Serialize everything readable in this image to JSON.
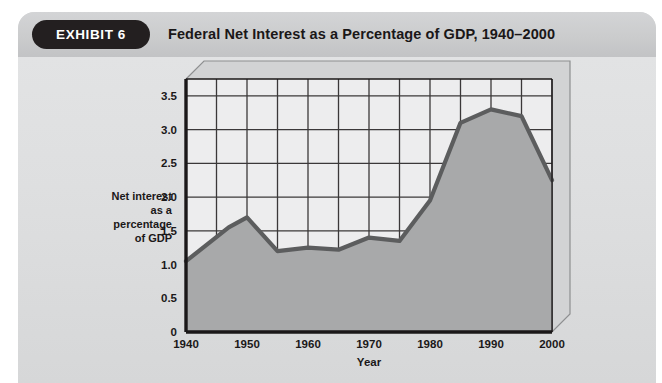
{
  "exhibit": {
    "badge_label": "EXHIBIT 6",
    "title": "Federal Net Interest as a Percentage of GDP, 1940–2000"
  },
  "colors": {
    "badge_background": "#231f20",
    "panel_header": "#cbcccd",
    "panel_body": "#dedfe0",
    "plot_background": "#ededee",
    "area_fill": "#a8a9aa",
    "line": "#5c5d5e",
    "axis": "#1b1819",
    "gridline": "#3b3839",
    "frame_3d": "#8e8f90"
  },
  "chart_data": {
    "type": "area",
    "title": "Federal Net Interest as a Percentage of GDP, 1940–2000",
    "xlabel": "Year",
    "ylabel": "Net interest as a percentage of GDP",
    "ylabel_lines": [
      "Net interest",
      "as a",
      "percentage",
      "of GDP"
    ],
    "xlim": [
      1940,
      2000
    ],
    "ylim": [
      0,
      3.75
    ],
    "grid": true,
    "grid_x_step": 5,
    "grid_y_step": 0.5,
    "legend": "none",
    "xticks": [
      1940,
      1950,
      1960,
      1970,
      1980,
      1990,
      2000
    ],
    "xtick_labels": [
      "1940",
      "1950",
      "1960",
      "1970",
      "1980",
      "1990",
      "2000"
    ],
    "yticks": [
      0,
      0.5,
      1.0,
      1.5,
      2.0,
      2.5,
      3.0,
      3.5
    ],
    "ytick_labels": [
      "0",
      "0.5",
      "1.0",
      "1.5",
      "2.0",
      "2.5",
      "3.0",
      "3.5"
    ],
    "series": [
      {
        "name": "Net interest as a percentage of GDP",
        "x": [
          1940,
          1947,
          1950,
          1955,
          1960,
          1965,
          1970,
          1975,
          1980,
          1985,
          1990,
          1995,
          2000
        ],
        "values": [
          1.05,
          1.55,
          1.7,
          1.2,
          1.25,
          1.22,
          1.4,
          1.35,
          1.95,
          3.1,
          3.3,
          3.2,
          2.25
        ]
      }
    ]
  }
}
